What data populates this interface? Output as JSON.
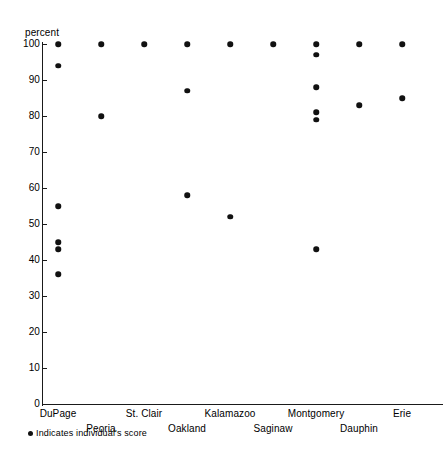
{
  "chart_data": {
    "type": "scatter",
    "title": "",
    "xlabel": "",
    "ylabel": "percent",
    "ylim": [
      0,
      100
    ],
    "yticks": [
      100,
      90,
      80,
      70,
      60,
      50,
      40,
      30,
      20,
      10,
      0
    ],
    "grid": false,
    "legend_position": "below-axis-left",
    "legend_entries": [
      "Indicates individual's score"
    ],
    "categories": [
      "DuPage",
      "Peoria",
      "St. Clair",
      "Oakland",
      "Kalamazoo",
      "Saginaw",
      "Montgomery",
      "Dauphin",
      "Erie"
    ],
    "series": [
      {
        "name": "individual scores",
        "points": [
          {
            "category": "DuPage",
            "values": [
              100,
              94,
              55,
              45,
              43,
              36
            ]
          },
          {
            "category": "Peoria",
            "values": [
              100,
              80
            ]
          },
          {
            "category": "St. Clair",
            "values": [
              100
            ]
          },
          {
            "category": "Oakland",
            "values": [
              100,
              87,
              58
            ]
          },
          {
            "category": "Kalamazoo",
            "values": [
              100,
              52
            ]
          },
          {
            "category": "Saginaw",
            "values": [
              100
            ]
          },
          {
            "category": "Montgomery",
            "values": [
              100,
              97,
              88,
              81,
              79,
              43
            ]
          },
          {
            "category": "Dauphin",
            "values": [
              100,
              83
            ]
          },
          {
            "category": "Erie",
            "values": [
              100,
              85
            ]
          }
        ]
      }
    ],
    "marker_color": "#111111",
    "axis_color": "#1a1a1a"
  },
  "axis": {
    "y_title": "percent"
  },
  "legend": {
    "text": "Indicates individual's score"
  }
}
